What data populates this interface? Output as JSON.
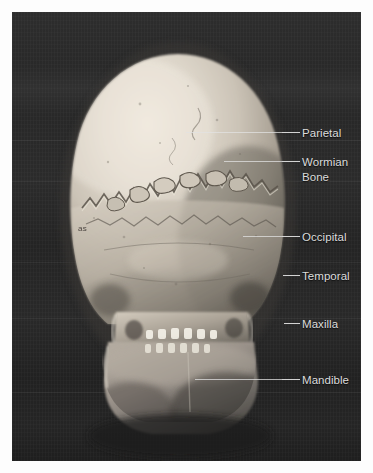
{
  "figure": {
    "view": "posterior view",
    "background_color": "#2b2b2b",
    "label_color": "#dcdcdc",
    "leader_line_color": "#e2e2e2",
    "bone_highlight_color": "#e9e2d6",
    "bone_midtone_color": "#b9b1a4",
    "bone_shadow_color": "#4e4a45",
    "specimen_mark": "as"
  },
  "annotations": [
    {
      "id": "parietal",
      "label": "Parietal",
      "label_x": 302,
      "label_y": 126,
      "line_x": 282,
      "line_y": 132,
      "line_width": 18,
      "lead_x": 186,
      "lead_y": 132,
      "lead_width": 96
    },
    {
      "id": "wormian-bone",
      "label": "Wormian\nBone",
      "label_x": 302,
      "label_y": 155,
      "line_x": 282,
      "line_y": 161,
      "line_width": 18,
      "lead_x": 224,
      "lead_y": 161,
      "lead_width": 58
    },
    {
      "id": "occipital",
      "label": "Occipital",
      "label_x": 302,
      "label_y": 230,
      "line_x": 282,
      "line_y": 236,
      "line_width": 18,
      "lead_x": 243,
      "lead_y": 236,
      "lead_width": 39
    },
    {
      "id": "temporal",
      "label": "Temporal",
      "label_x": 302,
      "label_y": 269,
      "line_x": 283,
      "line_y": 275,
      "line_width": 17,
      "lead_x": 283,
      "lead_y": 275,
      "lead_width": 0
    },
    {
      "id": "maxilla",
      "label": "Maxilla",
      "label_x": 302,
      "label_y": 317,
      "line_x": 284,
      "line_y": 323,
      "line_width": 16,
      "lead_x": 284,
      "lead_y": 323,
      "lead_width": 0
    },
    {
      "id": "mandible",
      "label": "Mandible",
      "label_x": 302,
      "label_y": 373,
      "line_x": 282,
      "line_y": 379,
      "line_width": 18,
      "lead_x": 195,
      "lead_y": 379,
      "lead_width": 87
    }
  ],
  "backdrop_seams": [
    140,
    181,
    262,
    318,
    392
  ]
}
